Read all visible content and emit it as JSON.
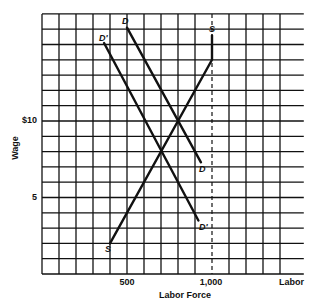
{
  "chart_data": {
    "type": "line",
    "title": "",
    "xlabel": "Labor Force",
    "ylabel": "Wage",
    "x_axis_end_label": "Labor",
    "xlim": [
      0,
      1540
    ],
    "ylim": [
      0,
      17
    ],
    "grid": true,
    "x_grid_step": 100,
    "y_grid_step": 1,
    "x_ticks": [
      {
        "value": 500,
        "label": "500"
      },
      {
        "value": 1000,
        "label": "1,000"
      }
    ],
    "y_ticks": [
      {
        "value": 5,
        "label": "5"
      },
      {
        "value": 10,
        "label": "$10"
      }
    ],
    "reference_lines": [
      {
        "type": "vertical",
        "x": 1000,
        "style": "dashed",
        "y_range": [
          0,
          17
        ]
      }
    ],
    "series": [
      {
        "name": "S",
        "label_start": "S",
        "label_end": "S",
        "points": [
          [
            400,
            2
          ],
          [
            1000,
            14
          ],
          [
            1000,
            15.6
          ]
        ]
      },
      {
        "name": "D",
        "label_start": "D",
        "label_end": "D",
        "points": [
          [
            500,
            16.1
          ],
          [
            935,
            7.3
          ]
        ]
      },
      {
        "name": "D'",
        "label_start": "D'",
        "label_end": "D'",
        "points": [
          [
            365,
            15.1
          ],
          [
            920,
            3.5
          ]
        ]
      }
    ],
    "annotations": [
      {
        "text": "Equilibrium S×D",
        "x": 800,
        "y": 10,
        "visible": false
      },
      {
        "text": "Equilibrium S×D'",
        "x": 700,
        "y": 8,
        "visible": false
      }
    ],
    "legend": "none"
  },
  "labels": {
    "y_axis_title": "Wage",
    "x_axis_title": "Labor Force",
    "x_axis_end": "Labor",
    "tick_500": "500",
    "tick_1000": "1,000",
    "tick_5": "5",
    "tick_10": "$10",
    "s_top": "S",
    "s_bottom": "S",
    "d_top": "D",
    "d_bottom": "D",
    "dp_top": "D'",
    "dp_bottom": "D'"
  }
}
